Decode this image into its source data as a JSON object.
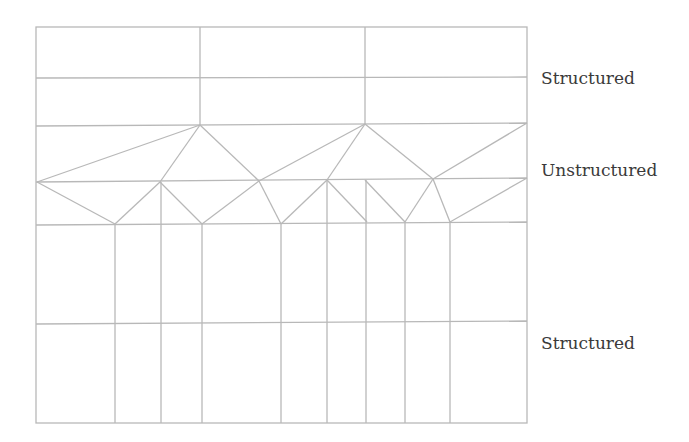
{
  "diagram": {
    "line_color": "#b8b8b8",
    "text_color": "#3a3a3a",
    "labels": [
      {
        "text": "Structured",
        "x": 541,
        "y": 68
      },
      {
        "text": "Unstructured",
        "x": 541,
        "y": 160
      },
      {
        "text": "Structured",
        "x": 541,
        "y": 333
      }
    ],
    "outer_frame": {
      "x1": 36,
      "y1": 27,
      "x2": 527,
      "y2": 423
    },
    "horizontal_lines": [
      [
        36,
        78,
        527,
        77
      ],
      [
        36,
        126,
        527,
        123
      ],
      [
        36,
        182,
        527,
        178
      ],
      [
        36,
        225,
        527,
        222
      ],
      [
        36,
        324,
        527,
        321
      ]
    ],
    "top_verticals": [
      [
        200,
        27,
        200,
        125
      ],
      [
        365,
        27,
        365,
        124
      ]
    ],
    "bottom_verticals": [
      [
        115,
        224,
        115,
        423
      ],
      [
        161,
        182,
        161,
        423
      ],
      [
        202,
        224,
        202,
        423
      ],
      [
        281,
        224,
        281,
        423
      ],
      [
        327,
        180,
        327,
        423
      ],
      [
        366,
        180,
        366,
        423
      ],
      [
        405,
        222,
        405,
        423
      ],
      [
        450,
        222,
        450,
        423
      ]
    ],
    "unstructured_edges": [
      [
        200,
        125,
        37,
        182
      ],
      [
        200,
        125,
        160,
        182
      ],
      [
        200,
        125,
        259,
        181
      ],
      [
        259,
        181,
        365,
        124
      ],
      [
        365,
        124,
        327,
        180
      ],
      [
        365,
        124,
        433,
        179
      ],
      [
        433,
        179,
        527,
        123
      ],
      [
        37,
        182,
        115,
        224
      ],
      [
        160,
        182,
        115,
        224
      ],
      [
        160,
        182,
        202,
        224
      ],
      [
        259,
        181,
        202,
        224
      ],
      [
        259,
        181,
        281,
        224
      ],
      [
        327,
        180,
        281,
        224
      ],
      [
        327,
        180,
        367,
        222
      ],
      [
        365,
        180,
        405,
        222
      ],
      [
        433,
        179,
        405,
        222
      ],
      [
        433,
        179,
        450,
        222
      ],
      [
        527,
        178,
        450,
        222
      ]
    ]
  }
}
